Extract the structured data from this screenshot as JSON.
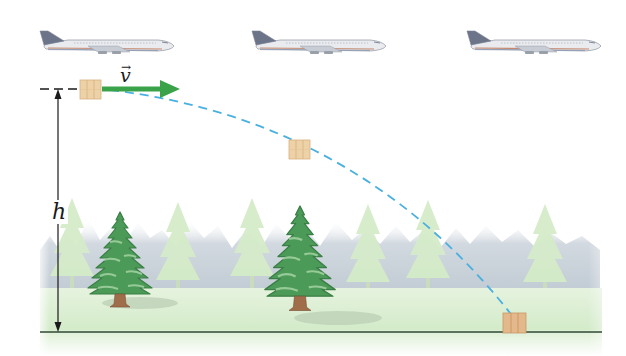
{
  "figure": {
    "labels": {
      "velocity": "v",
      "velocity_vector_mark": "→",
      "height": "h"
    },
    "airplanes": [
      {
        "x": 38,
        "y": 30
      },
      {
        "x": 250,
        "y": 30
      },
      {
        "x": 465,
        "y": 30
      }
    ],
    "packages": [
      {
        "x": 80,
        "y": 80,
        "stage": "release"
      },
      {
        "x": 289,
        "y": 140,
        "stage": "mid-flight"
      },
      {
        "x": 503,
        "y": 313,
        "stage": "landed"
      }
    ],
    "colors": {
      "velocity_arrow": "#3aa34a",
      "trajectory": "#4ab0e0",
      "package": "#e8c79a",
      "tree_dark": "#3d8a4a",
      "ground": "#dcefd4",
      "ground_line": "#2f4a34",
      "background_trees": "#c9d3dc"
    }
  }
}
